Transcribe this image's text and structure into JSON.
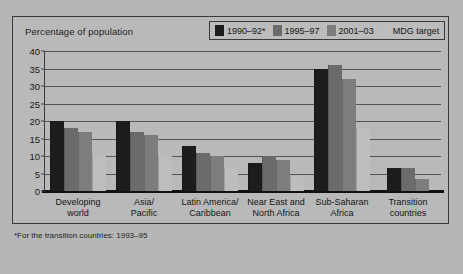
{
  "chart_data": {
    "type": "bar",
    "title": "",
    "ylabel": "Percentage of population",
    "xlabel": "",
    "ylim": [
      0,
      40
    ],
    "yticks": [
      "0",
      "5",
      "10",
      "15",
      "20",
      "25",
      "30",
      "35",
      "40"
    ],
    "grid": true,
    "legend_position": "top-right",
    "footnote": "*For the transition countries: 1993–95",
    "categories": [
      "Developing\nworld",
      "Asia/\nPacific",
      "Latin America/\nCaribbean",
      "Near East and\nNorth Africa",
      "Sub-Saharan\nAfrica",
      "Transition\ncountries"
    ],
    "category_lines": [
      [
        "Developing",
        "world"
      ],
      [
        "Asia/",
        "Pacific"
      ],
      [
        "Latin America/",
        "Caribbean"
      ],
      [
        "Near East and",
        "North Africa"
      ],
      [
        "Sub-Saharan",
        "Africa"
      ],
      [
        "Transition",
        "countries"
      ]
    ],
    "series": [
      {
        "name": "1990–92*",
        "color": "#1c1c1c",
        "values": [
          20,
          20,
          13,
          8,
          35,
          6.5
        ]
      },
      {
        "name": "1995–97",
        "color": "#6b6b6b",
        "values": [
          18,
          17,
          11,
          10,
          36,
          6.5
        ]
      },
      {
        "name": "2001–03",
        "color": "#7d7d7d",
        "values": [
          17,
          16,
          10,
          9,
          32,
          3.5
        ]
      },
      {
        "name": "MDG target",
        "color": "#bdbdbd",
        "values": [
          10,
          10,
          6.5,
          4,
          18,
          null
        ]
      }
    ]
  },
  "colors": {
    "background": "#b6b6b6",
    "panel": "#b9b9b9",
    "border": "#3a3a3a",
    "gridline": "#555555",
    "axis": "#111111",
    "text": "#141414"
  }
}
